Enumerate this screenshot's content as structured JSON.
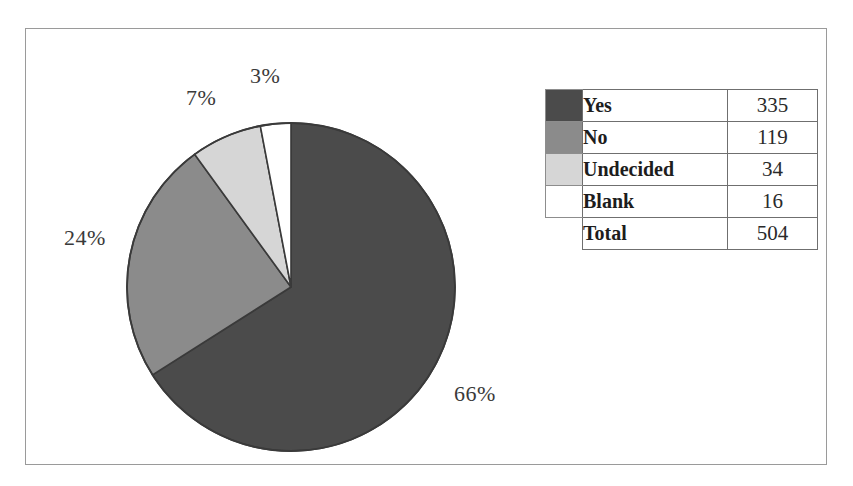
{
  "chart_data": {
    "type": "pie",
    "title": "",
    "subtitle": "",
    "xlabel": "",
    "ylabel": "",
    "legend_position": "right",
    "grid": false,
    "categories": [
      "Yes",
      "No",
      "Undecided",
      "Blank"
    ],
    "values": [
      335,
      119,
      34,
      16
    ],
    "percent_labels": [
      "66%",
      "24%",
      "7%",
      "3%"
    ],
    "percents": [
      66,
      24,
      7,
      3
    ],
    "total_label": "Total",
    "total_value": 504,
    "slice_colors": [
      "#4b4b4b",
      "#8b8b8b",
      "#d6d6d6",
      "#ffffff"
    ],
    "start_angle_deg": 0,
    "direction": "clockwise",
    "annotations": [
      {
        "name": "yes-percent",
        "text": "66%"
      },
      {
        "name": "no-percent",
        "text": "24%"
      },
      {
        "name": "undecided-percent",
        "text": "7%"
      },
      {
        "name": "blank-percent",
        "text": "3%"
      }
    ]
  },
  "legend": {
    "columns": [
      "",
      "Category",
      "Count"
    ],
    "rows": [
      {
        "label": "Yes",
        "value": "335",
        "color": "#4b4b4b",
        "has_swatch": true
      },
      {
        "label": "No",
        "value": "119",
        "color": "#8b8b8b",
        "has_swatch": true
      },
      {
        "label": "Undecided",
        "value": "34",
        "color": "#d6d6d6",
        "has_swatch": true
      },
      {
        "label": "Blank",
        "value": "16",
        "color": "#ffffff",
        "has_swatch": true
      },
      {
        "label": "Total",
        "value": "504",
        "color": "",
        "has_swatch": false
      }
    ]
  },
  "style": {
    "frame_border": "#9a9a9a",
    "pie_outline": "#3a3a3a",
    "label_color": "#3a3a3a"
  }
}
